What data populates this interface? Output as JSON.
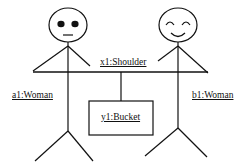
{
  "diagram": {
    "type": "UML object diagram (collaboration)",
    "objects": {
      "left_person": {
        "label": "a1:Woman",
        "face": "neutral"
      },
      "right_person": {
        "label": "b1:Woman",
        "face": "smiling"
      },
      "shoulder": {
        "label": "x1:Shoulder"
      },
      "bucket": {
        "label": "y1:Bucket"
      }
    },
    "colors": {
      "stroke": "#111111",
      "background": "#ffffff"
    }
  }
}
